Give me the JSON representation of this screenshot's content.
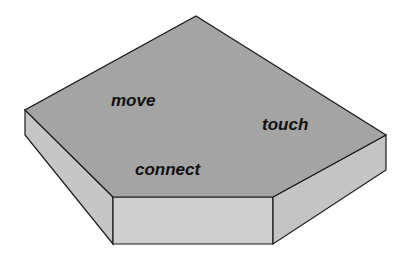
{
  "diagram": {
    "shape": "pentagonal-slab",
    "labels": {
      "move": "move",
      "touch": "touch",
      "connect": "connect"
    },
    "colors": {
      "top_face": "#a4a4a4",
      "side_face": "#c8c8c8",
      "front_face": "#cfcfcf",
      "right_face": "#c4c4c4",
      "outline": "#1a1a1a",
      "text": "#111111"
    }
  }
}
